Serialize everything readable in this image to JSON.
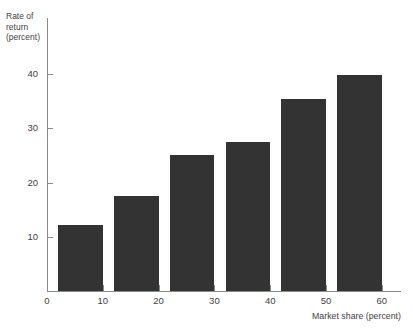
{
  "figure": {
    "background_color": "#ffffff",
    "bar_color": "#333333",
    "axis_color": "#8a8a8a",
    "text_color": "#3f3f3f"
  },
  "axis_titles": {
    "y_line1": "Rate of",
    "y_line2": "return",
    "y_line3": "(percent)",
    "x": "Market share (percent)"
  },
  "ticks": {
    "y": [
      "10",
      "20",
      "30",
      "40"
    ],
    "x": [
      "0",
      "10",
      "20",
      "30",
      "40",
      "50",
      "60"
    ]
  },
  "chart_data": {
    "type": "bar",
    "title": "",
    "subtitle": "",
    "xlabel": "Market share (percent)",
    "ylabel": "Rate of return (percent)",
    "categories": [
      "0-10",
      "10-20",
      "20-30",
      "30-40",
      "40-50",
      "50-60"
    ],
    "x": [
      6,
      16,
      26,
      36,
      46,
      56
    ],
    "values": [
      12.2,
      17.5,
      25.0,
      27.5,
      35.3,
      39.8
    ],
    "xlim": [
      0,
      64
    ],
    "ylim": [
      0,
      46
    ],
    "xticks": [
      0,
      10,
      20,
      30,
      40,
      50,
      60
    ],
    "yticks": [
      10,
      20,
      30,
      40
    ],
    "grid": false,
    "legend": "none",
    "bar_color": "#333333",
    "bar_width_units": 8
  }
}
